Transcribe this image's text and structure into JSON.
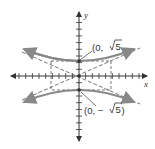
{
  "diagram": {
    "type": "hyperbola",
    "equation_hint": "vertical transverse axis, vertices on y-axis",
    "axes": {
      "x_label": "x",
      "y_label": "y"
    },
    "vertices": [
      {
        "label": "(0, √5)",
        "x": 0,
        "y": 2.236
      },
      {
        "label": "(0, − √5)",
        "x": 0,
        "y": -2.236
      }
    ],
    "labels": {
      "top_vertex_prefix": "(0, ",
      "top_vertex_root": "5",
      "top_vertex_suffix": "",
      "bottom_vertex_prefix": "(0, − ",
      "bottom_vertex_root": "5",
      "bottom_vertex_suffix": ")"
    },
    "colors": {
      "axis": "#333333",
      "curve": "#888888",
      "dashed": "#555555"
    }
  }
}
